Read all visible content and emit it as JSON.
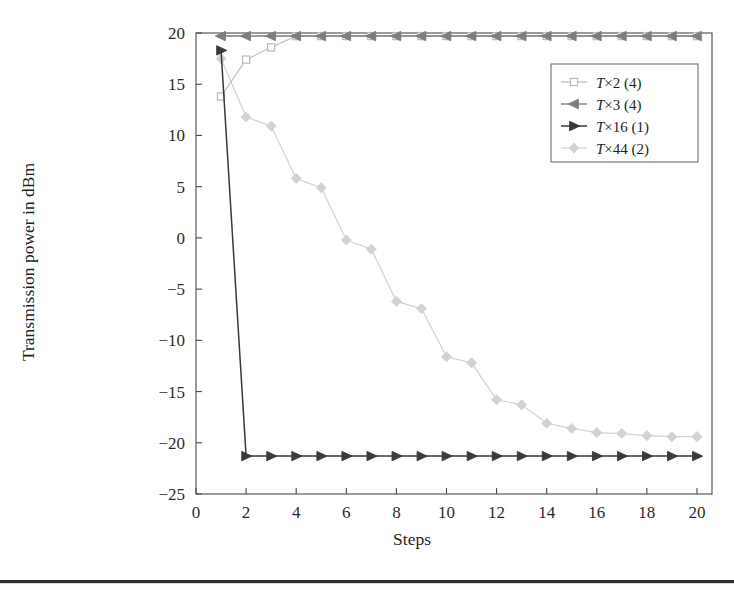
{
  "chart_data": {
    "type": "line",
    "title": "",
    "subtitle": "",
    "xlabel": "Steps",
    "ylabel": "Transmission power in dBm",
    "xlim": [
      0,
      20.6
    ],
    "ylim": [
      -25,
      20
    ],
    "xticks": [
      0,
      2,
      4,
      6,
      8,
      10,
      12,
      14,
      16,
      18,
      20
    ],
    "yticks": [
      20,
      15,
      10,
      5,
      0,
      -5,
      -10,
      -15,
      -20,
      -25
    ],
    "xtick_labels": [
      "0",
      "2",
      "4",
      "6",
      "8",
      "10",
      "12",
      "14",
      "16",
      "18",
      "20"
    ],
    "ytick_labels": [
      "20",
      "15",
      "10",
      "5",
      "0",
      "−5",
      "−10",
      "−15",
      "−20",
      "−25"
    ],
    "grid": false,
    "legend_position": "upper right",
    "x": [
      1,
      2,
      3,
      4,
      5,
      6,
      7,
      8,
      9,
      10,
      11,
      12,
      13,
      14,
      15,
      16,
      17,
      18,
      19,
      20
    ],
    "series": [
      {
        "name": "T×2 (4)",
        "label_prefix": "T",
        "label_suffix": "×2 (4)",
        "marker": "square",
        "color": "#b9b9b9",
        "linewidth": 1.1,
        "values": [
          13.8,
          17.4,
          18.6,
          19.7,
          19.7,
          19.7,
          19.7,
          19.7,
          19.7,
          19.7,
          19.7,
          19.7,
          19.7,
          19.7,
          19.7,
          19.7,
          19.7,
          19.7,
          19.7,
          19.7
        ]
      },
      {
        "name": "T×3 (4)",
        "label_prefix": "T",
        "label_suffix": "×3 (4)",
        "marker": "triangle-left",
        "color": "#7d7d7d",
        "linewidth": 1.4,
        "values": [
          19.7,
          19.7,
          19.7,
          19.7,
          19.7,
          19.7,
          19.7,
          19.7,
          19.7,
          19.7,
          19.7,
          19.7,
          19.7,
          19.7,
          19.7,
          19.7,
          19.7,
          19.7,
          19.7,
          19.7
        ]
      },
      {
        "name": "T×16 (1)",
        "label_prefix": "T",
        "label_suffix": "×16 (1)",
        "marker": "triangle-right",
        "color": "#3a3a3a",
        "linewidth": 1.5,
        "values": [
          18.3,
          -21.3,
          -21.3,
          -21.3,
          -21.3,
          -21.3,
          -21.3,
          -21.3,
          -21.3,
          -21.3,
          -21.3,
          -21.3,
          -21.3,
          -21.3,
          -21.3,
          -21.3,
          -21.3,
          -21.3,
          -21.3,
          -21.3
        ]
      },
      {
        "name": "T×44 (2)",
        "label_prefix": "T",
        "label_suffix": "×44 (2)",
        "marker": "diamond",
        "color": "#d2d2d2",
        "linewidth": 1.2,
        "values": [
          17.5,
          11.8,
          10.9,
          5.8,
          4.9,
          -0.2,
          -1.1,
          -6.2,
          -6.9,
          -11.6,
          -12.2,
          -15.8,
          -16.3,
          -18.1,
          -18.6,
          -19.0,
          -19.1,
          -19.3,
          -19.4,
          -19.4
        ]
      }
    ]
  },
  "legend": {
    "entries": [
      {
        "prefix": "T",
        "text": "×2 (4)"
      },
      {
        "prefix": "T",
        "text": "×3 (4)"
      },
      {
        "prefix": "T",
        "text": "×16 (1)"
      },
      {
        "prefix": "T",
        "text": "×44 (2)"
      }
    ]
  }
}
